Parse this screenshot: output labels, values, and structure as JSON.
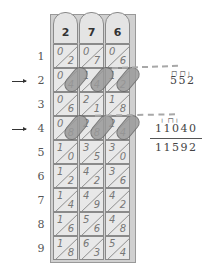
{
  "diagram": {
    "rods": [
      {
        "header": "2",
        "cells": [
          [
            "0",
            "2"
          ],
          [
            "0",
            "4"
          ],
          [
            "0",
            "6"
          ],
          [
            "0",
            "8"
          ],
          [
            "1",
            "0"
          ],
          [
            "1",
            "2"
          ],
          [
            "1",
            "4"
          ],
          [
            "1",
            "6"
          ],
          [
            "1",
            "8"
          ]
        ]
      },
      {
        "header": "7",
        "cells": [
          [
            "0",
            "7"
          ],
          [
            "1",
            "4"
          ],
          [
            "2",
            "1"
          ],
          [
            "2",
            "8"
          ],
          [
            "3",
            "5"
          ],
          [
            "4",
            "2"
          ],
          [
            "4",
            "9"
          ],
          [
            "5",
            "6"
          ],
          [
            "6",
            "3"
          ]
        ]
      },
      {
        "header": "6",
        "cells": [
          [
            "0",
            "6"
          ],
          [
            "1",
            "2"
          ],
          [
            "1",
            "8"
          ],
          [
            "2",
            "4"
          ],
          [
            "3",
            "0"
          ],
          [
            "3",
            "6"
          ],
          [
            "4",
            "2"
          ],
          [
            "4",
            "8"
          ],
          [
            "5",
            "4"
          ]
        ]
      }
    ],
    "row_labels": [
      "1",
      "2",
      "3",
      "4",
      "5",
      "6",
      "7",
      "8",
      "9"
    ],
    "highlighted_rows": [
      "2",
      "4"
    ],
    "arrows": [
      "arrow-row-2",
      "arrow-row-4"
    ],
    "results": {
      "row_2_product": "552",
      "row_4_product": "11040",
      "sum": "11592"
    },
    "colors": {
      "cell_fill": "#e8e8e8",
      "highlight_fill": "#9a9a9a",
      "border": "#8a8a8a",
      "text": "#777777"
    }
  }
}
